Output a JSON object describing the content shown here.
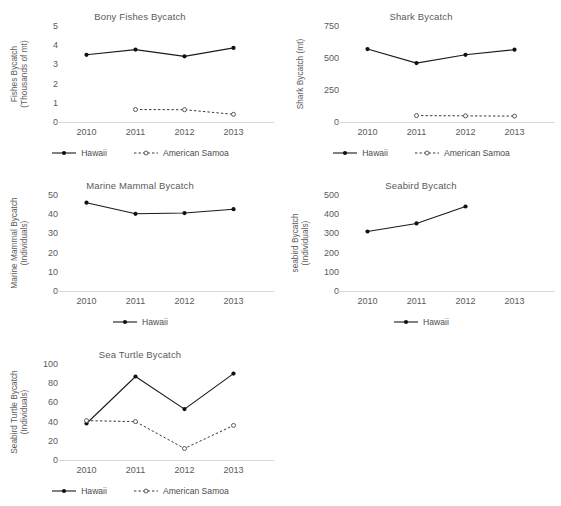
{
  "figure": {
    "background": "#ffffff",
    "text_color": "#5a5a5a",
    "series_colors": {
      "hawaii": "#111111",
      "american_samoa": "#4a4a4a"
    },
    "axis_color": "#d9d9d9"
  },
  "legend_labels": {
    "hawaii": "Hawaii",
    "american_samoa": "American Samoa"
  },
  "chart_data": [
    {
      "id": "bony-fishes",
      "type": "line",
      "title": "Bony Fishes Bycatch",
      "xlabel": "",
      "ylabel": "Fishes Bycatch (Thousands of mt)",
      "ylabel_lines": [
        "Fishes Bycatch",
        "(Thousands of mt)"
      ],
      "categories": [
        "2010",
        "2011",
        "2012",
        "2013"
      ],
      "yticks": [
        "0",
        "1",
        "2",
        "3",
        "4",
        "5"
      ],
      "ylim": [
        0,
        5
      ],
      "grid": false,
      "legend_position": "bottom",
      "series": [
        {
          "name": "Hawaii",
          "style": "solid",
          "marker": "filled-circle",
          "values": [
            3.5,
            3.77,
            3.42,
            3.86
          ]
        },
        {
          "name": "American Samoa",
          "style": "dashed",
          "marker": "open-circle",
          "values": [
            null,
            0.65,
            0.64,
            0.4
          ]
        }
      ]
    },
    {
      "id": "shark",
      "type": "line",
      "title": "Shark Bycatch",
      "xlabel": "",
      "ylabel": "Shark Bycatch (mt)",
      "ylabel_lines": [
        "Shark Bycatch (mt)"
      ],
      "categories": [
        "2010",
        "2011",
        "2012",
        "2013"
      ],
      "yticks": [
        "0",
        "250",
        "500",
        "750"
      ],
      "ylim": [
        0,
        750
      ],
      "grid": false,
      "legend_position": "bottom",
      "series": [
        {
          "name": "Hawaii",
          "style": "solid",
          "marker": "filled-circle",
          "values": [
            570,
            460,
            525,
            565
          ]
        },
        {
          "name": "American Samoa",
          "style": "dashed",
          "marker": "open-circle",
          "values": [
            null,
            50,
            48,
            46
          ]
        }
      ]
    },
    {
      "id": "marine-mammal",
      "type": "line",
      "title": "Marine Mammal Bycatch",
      "xlabel": "",
      "ylabel": "Marine Mammal Bycatch (Individuals)",
      "ylabel_lines": [
        "Marine Mammal Bycatch",
        "(Individuals)"
      ],
      "categories": [
        "2010",
        "2011",
        "2012",
        "2013"
      ],
      "yticks": [
        "0",
        "10",
        "20",
        "30",
        "40",
        "50"
      ],
      "ylim": [
        0,
        50
      ],
      "grid": false,
      "legend_position": "bottom",
      "series": [
        {
          "name": "Hawaii",
          "style": "solid",
          "marker": "filled-circle",
          "values": [
            46,
            40.2,
            40.6,
            42.6
          ]
        }
      ]
    },
    {
      "id": "seabird",
      "type": "line",
      "title": "Seabird Bycatch",
      "xlabel": "",
      "ylabel": "seabird Bycatch (Individuals)",
      "ylabel_lines": [
        "seabird Bycatch",
        "(Individuals)"
      ],
      "categories": [
        "2010",
        "2011",
        "2012",
        "2013"
      ],
      "yticks": [
        "0",
        "100",
        "200",
        "300",
        "400",
        "500"
      ],
      "ylim": [
        0,
        500
      ],
      "grid": false,
      "legend_position": "bottom",
      "series": [
        {
          "name": "Hawaii",
          "style": "solid",
          "marker": "filled-circle",
          "values": [
            310,
            352,
            440,
            null
          ]
        }
      ]
    },
    {
      "id": "sea-turtle",
      "type": "line",
      "title": "Sea Turtle Bycatch",
      "xlabel": "",
      "ylabel": "Seabird Turtle Bycatch (Individuals)",
      "ylabel_lines": [
        "Seabird Turtle Bycatch",
        "(Individuals)"
      ],
      "categories": [
        "2010",
        "2011",
        "2012",
        "2013"
      ],
      "yticks": [
        "0",
        "20",
        "40",
        "60",
        "80",
        "100"
      ],
      "ylim": [
        0,
        100
      ],
      "grid": false,
      "legend_position": "bottom",
      "series": [
        {
          "name": "Hawaii",
          "style": "solid",
          "marker": "filled-circle",
          "values": [
            38,
            87,
            53,
            90
          ]
        },
        {
          "name": "American Samoa",
          "style": "dashed",
          "marker": "open-circle",
          "values": [
            41,
            40,
            12,
            36
          ]
        }
      ]
    }
  ],
  "panel_layout": [
    {
      "id": "bony-fishes",
      "x": 0,
      "y": 4,
      "w": 280,
      "h": 166
    },
    {
      "id": "shark",
      "x": 281,
      "y": 4,
      "w": 280,
      "h": 166
    },
    {
      "id": "marine-mammal",
      "x": 0,
      "y": 173,
      "w": 280,
      "h": 166
    },
    {
      "id": "seabird",
      "x": 281,
      "y": 173,
      "w": 280,
      "h": 166
    },
    {
      "id": "sea-turtle",
      "x": 0,
      "y": 342,
      "w": 280,
      "h": 164
    }
  ]
}
